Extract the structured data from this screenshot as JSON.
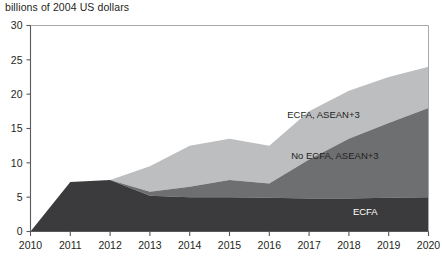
{
  "chart_data": {
    "type": "area",
    "stacked": true,
    "title": "billions of 2004 US dollars",
    "xlabel": "",
    "ylabel": "",
    "x": [
      2010,
      2011,
      2012,
      2013,
      2014,
      2015,
      2016,
      2017,
      2018,
      2019,
      2020
    ],
    "xtick_labels": [
      "2010",
      "2011",
      "2012",
      "2013",
      "2014",
      "2015",
      "2016",
      "2017",
      "2018",
      "2019",
      "2020"
    ],
    "ytick_labels": [
      "0",
      "5",
      "10",
      "15",
      "20",
      "25",
      "30"
    ],
    "yticks": [
      0,
      5,
      10,
      15,
      20,
      25,
      30
    ],
    "xlim": [
      2010,
      2020
    ],
    "ylim": [
      0,
      30
    ],
    "grid": false,
    "legend_position": "inline-annotations",
    "series": [
      {
        "name": "ECFA",
        "color": "#3b3b3d",
        "label_x": 2018.1,
        "label_y": 2.4,
        "label_on_dark": true,
        "values": [
          0,
          7.2,
          7.5,
          5.2,
          5.0,
          5.0,
          4.9,
          4.8,
          4.8,
          4.9,
          5.0
        ]
      },
      {
        "name": "No ECFA, ASEAN+3",
        "color": "#6e6f71",
        "label_x": 2016.55,
        "label_y": 10.6,
        "label_on_dark": false,
        "values": [
          0,
          0.0,
          0.0,
          0.6,
          1.5,
          2.5,
          2.1,
          5.7,
          8.7,
          10.9,
          13.0
        ]
      },
      {
        "name": "ECFA, ASEAN+3",
        "color": "#bcbec0",
        "label_x": 2016.45,
        "label_y": 16.6,
        "label_on_dark": false,
        "values": [
          0,
          0.0,
          0.0,
          3.7,
          6.0,
          6.0,
          5.5,
          7.0,
          7.0,
          6.7,
          6.0
        ]
      }
    ],
    "cumulative_tops": {
      "ECFA": [
        0,
        7.2,
        7.5,
        5.2,
        5.0,
        5.0,
        4.9,
        4.8,
        4.8,
        4.9,
        5.0
      ],
      "No ECFA, ASEAN+3": [
        0,
        7.2,
        7.5,
        5.8,
        6.5,
        7.5,
        7.0,
        10.5,
        13.5,
        15.8,
        18.0
      ],
      "ECFA, ASEAN+3": [
        0,
        7.2,
        7.5,
        9.5,
        12.5,
        13.5,
        12.5,
        17.5,
        20.5,
        22.5,
        24.0
      ]
    }
  }
}
